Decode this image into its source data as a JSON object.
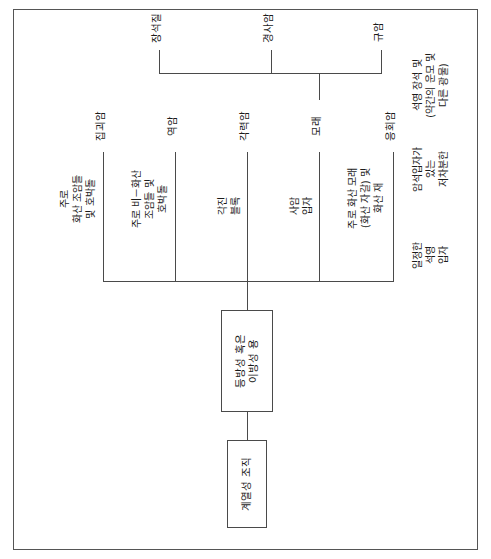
{
  "figure": {
    "kind": "hierarchical-tree-diagram",
    "language": "ko",
    "orientation": "rotated-90-ccw",
    "line_color": "#4a4a4a",
    "box_border_color": "#4a4a4a",
    "text_color": "#1b1b1b",
    "background": "#ffffff"
  },
  "root": {
    "label": "계열성 조직"
  },
  "level2": {
    "label": "등방성 혹은\n이방성 용"
  },
  "branches": [
    {
      "descriptor": "주로\n화산 조암들\n및 호박돌",
      "term": "집괴암"
    },
    {
      "descriptor": "주로 비－화산\n조암들 및\n호박돌",
      "term": "역암"
    },
    {
      "descriptor": "각진\n블록",
      "term": "각력암"
    },
    {
      "descriptor": "사암\n입자",
      "term": "모래"
    },
    {
      "descriptor": "주로 화산 모래\n(화산 자갈) 및\n화산 재",
      "term": "응회암"
    }
  ],
  "sub_branches": {
    "parent_term": "모래",
    "items": [
      {
        "term": "규암",
        "descriptor": "일정한\n석영\n입자"
      },
      {
        "term": "경사암",
        "descriptor": "암석입자가\n있는\n저차분한"
      },
      {
        "term": "장석질",
        "descriptor": "석영 장석 및\n(약간의 운모 및\n다른 광물)"
      }
    ]
  }
}
